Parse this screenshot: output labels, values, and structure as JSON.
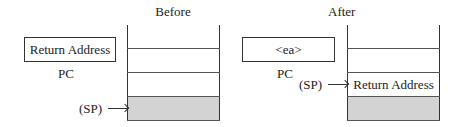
{
  "before": {
    "title": "Before",
    "pc_value": "Return Address",
    "pc_label": "PC",
    "sp_label": "(SP)",
    "stack_cells": [
      "",
      "",
      ""
    ],
    "sp_points_to_cell": 2
  },
  "after": {
    "title": "After",
    "pc_value": "<ea>",
    "pc_label": "PC",
    "sp_label": "(SP)",
    "stack_cells": [
      "",
      "Return Address",
      ""
    ],
    "sp_points_to_cell": 1
  },
  "colors": {
    "shaded_cell": "#d3d3d3",
    "line": "#333333"
  }
}
